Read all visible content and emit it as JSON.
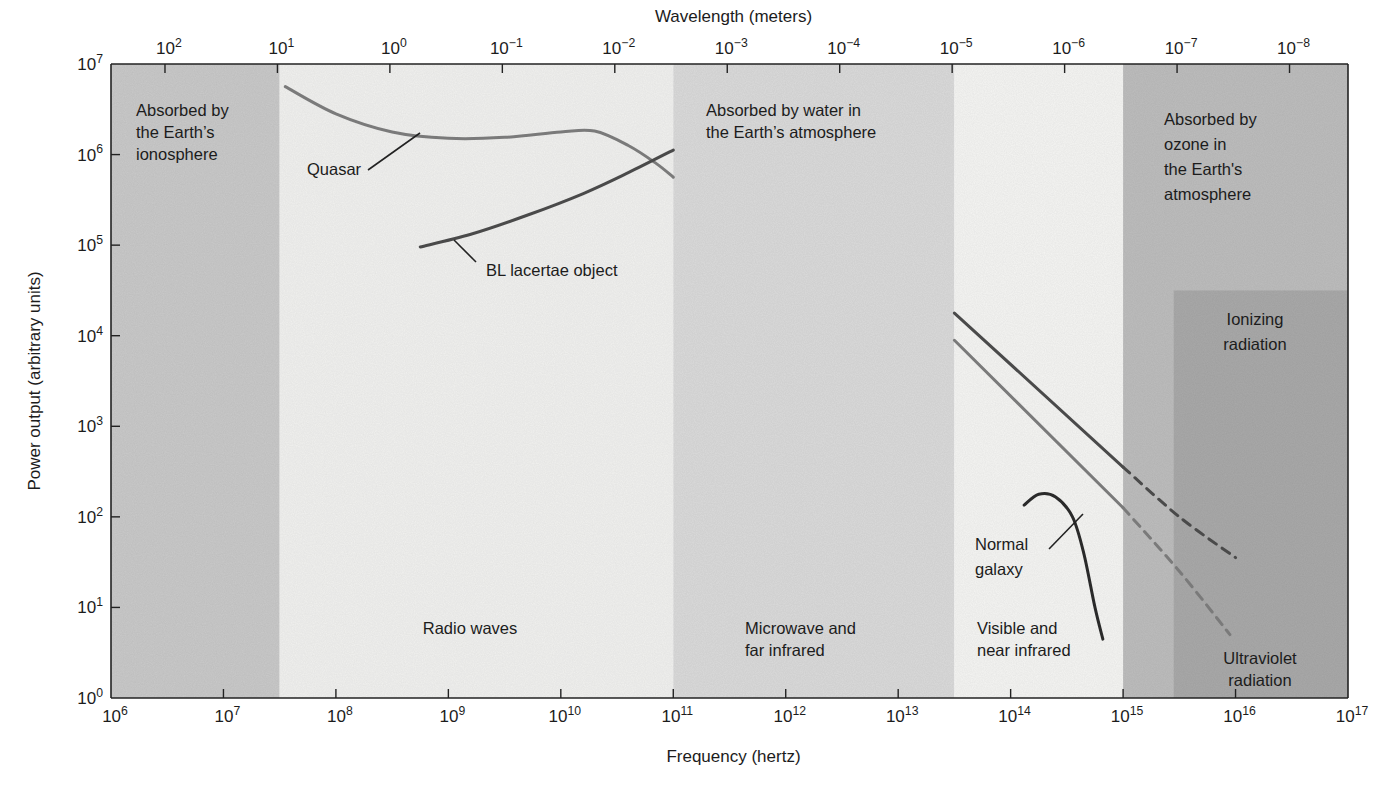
{
  "chart_data": {
    "type": "line",
    "title": "",
    "xlabel": "Frequency (hertz)",
    "ylabel": "Power output (arbitrary units)",
    "x2label": "Wavelength (meters)",
    "xscale": "log",
    "yscale": "log",
    "xlim": [
      1000000.0,
      1e+17
    ],
    "ylim": [
      1,
      10000000.0
    ],
    "grid": false,
    "legend": "none (curves labeled inline)",
    "x_ticks": [
      {
        "exp": 6,
        "label": "10",
        "sup": "6"
      },
      {
        "exp": 7,
        "label": "10",
        "sup": "7"
      },
      {
        "exp": 8,
        "label": "10",
        "sup": "8"
      },
      {
        "exp": 9,
        "label": "10",
        "sup": "9"
      },
      {
        "exp": 10,
        "label": "10",
        "sup": "10"
      },
      {
        "exp": 11,
        "label": "10",
        "sup": "11"
      },
      {
        "exp": 12,
        "label": "10",
        "sup": "12"
      },
      {
        "exp": 13,
        "label": "10",
        "sup": "13"
      },
      {
        "exp": 14,
        "label": "10",
        "sup": "14"
      },
      {
        "exp": 15,
        "label": "10",
        "sup": "15"
      },
      {
        "exp": 16,
        "label": "10",
        "sup": "16"
      },
      {
        "exp": 17,
        "label": "10",
        "sup": "17"
      }
    ],
    "y_ticks": [
      {
        "exp": 0,
        "label": "10",
        "sup": "0"
      },
      {
        "exp": 1,
        "label": "10",
        "sup": "1"
      },
      {
        "exp": 2,
        "label": "10",
        "sup": "2"
      },
      {
        "exp": 3,
        "label": "10",
        "sup": "3"
      },
      {
        "exp": 4,
        "label": "10",
        "sup": "4"
      },
      {
        "exp": 5,
        "label": "10",
        "sup": "5"
      },
      {
        "exp": 6,
        "label": "10",
        "sup": "6"
      },
      {
        "exp": 7,
        "label": "10",
        "sup": "7"
      }
    ],
    "wavelength_ticks": [
      {
        "freq_exp": 6.48,
        "label": "10",
        "sup": "2"
      },
      {
        "freq_exp": 7.48,
        "label": "10",
        "sup": "1"
      },
      {
        "freq_exp": 8.48,
        "label": "10",
        "sup": "0"
      },
      {
        "freq_exp": 9.48,
        "label": "10",
        "sup": "−1"
      },
      {
        "freq_exp": 10.48,
        "label": "10",
        "sup": "−2"
      },
      {
        "freq_exp": 11.48,
        "label": "10",
        "sup": "−3"
      },
      {
        "freq_exp": 12.48,
        "label": "10",
        "sup": "−4"
      },
      {
        "freq_exp": 13.48,
        "label": "10",
        "sup": "−5"
      },
      {
        "freq_exp": 14.48,
        "label": "10",
        "sup": "−6"
      },
      {
        "freq_exp": 15.48,
        "label": "10",
        "sup": "−7"
      },
      {
        "freq_exp": 16.48,
        "label": "10",
        "sup": "−8"
      }
    ],
    "bands": [
      {
        "name": "ionosphere",
        "from_exp": 6,
        "to_exp": 7.5,
        "y_from_exp": 0,
        "y_to_exp": 7,
        "color": "#c9c9c9",
        "labels": [
          "Absorbed by",
          "the Earth’s",
          "ionosphere"
        ]
      },
      {
        "name": "radio",
        "from_exp": 7.5,
        "to_exp": 11,
        "y_from_exp": 0,
        "y_to_exp": 7,
        "color": "#f1f1ef",
        "labels": [
          "Radio waves"
        ]
      },
      {
        "name": "microwave",
        "from_exp": 11,
        "to_exp": 13.5,
        "y_from_exp": 0,
        "y_to_exp": 7,
        "color": "#dadada",
        "labels": [
          "Microwave and",
          "far infrared"
        ],
        "top_labels": [
          "Absorbed by water in",
          "the Earth’s atmosphere"
        ]
      },
      {
        "name": "visible",
        "from_exp": 13.5,
        "to_exp": 15,
        "y_from_exp": 0,
        "y_to_exp": 7,
        "color": "#f5f5f3",
        "labels": [
          "Visible and",
          "near infrared"
        ]
      },
      {
        "name": "ozone",
        "from_exp": 15,
        "to_exp": 17,
        "y_from_exp": 0,
        "y_to_exp": 7,
        "color": "#bdbdbd",
        "labels": [
          "Absorbed by",
          "ozone in",
          "the Earth's",
          "atmosphere"
        ]
      },
      {
        "name": "ionizing",
        "from_exp": 15.45,
        "to_exp": 17,
        "y_from_exp": 0,
        "y_to_exp": 4.5,
        "color": "#a9a9a9",
        "labels": [
          "Ionizing",
          "radiation"
        ],
        "bottom_labels": [
          "Ultraviolet",
          "radiation"
        ]
      }
    ],
    "series": [
      {
        "name": "Quasar",
        "color": "#7a7a7a",
        "style": "solid",
        "points": [
          [
            7.55,
            6.75
          ],
          [
            8.0,
            6.45
          ],
          [
            8.5,
            6.25
          ],
          [
            9.0,
            6.18
          ],
          [
            9.5,
            6.19
          ],
          [
            10.0,
            6.25
          ],
          [
            10.3,
            6.26
          ],
          [
            10.6,
            6.1
          ],
          [
            10.85,
            5.9
          ],
          [
            11.0,
            5.75
          ]
        ]
      },
      {
        "name": "BL lacertae object",
        "color": "#4a4a4a",
        "style": "solid",
        "points": [
          [
            8.75,
            4.98
          ],
          [
            9.2,
            5.12
          ],
          [
            9.7,
            5.33
          ],
          [
            10.2,
            5.57
          ],
          [
            10.6,
            5.8
          ],
          [
            11.0,
            6.05
          ]
        ]
      },
      {
        "name": "Quasar (optical/UV)",
        "color": "#7a7a7a",
        "style": "solid",
        "points": [
          [
            13.5,
            3.95
          ],
          [
            15.0,
            2.1
          ]
        ]
      },
      {
        "name": "Quasar (UV extrapolated)",
        "color": "#7a7a7a",
        "style": "dashed",
        "points": [
          [
            15.0,
            2.1
          ],
          [
            15.5,
            1.4
          ],
          [
            15.95,
            0.7
          ]
        ]
      },
      {
        "name": "BL lacertae object (optical/UV)",
        "color": "#4a4a4a",
        "style": "solid",
        "points": [
          [
            13.5,
            4.25
          ],
          [
            15.0,
            2.55
          ]
        ]
      },
      {
        "name": "BL lacertae object (UV extrapolated)",
        "color": "#4a4a4a",
        "style": "dashed",
        "points": [
          [
            15.0,
            2.55
          ],
          [
            15.5,
            2.0
          ],
          [
            16.0,
            1.55
          ]
        ]
      },
      {
        "name": "Normal galaxy",
        "color": "#2a2a2a",
        "style": "solid",
        "points": [
          [
            14.12,
            2.13
          ],
          [
            14.25,
            2.25
          ],
          [
            14.4,
            2.22
          ],
          [
            14.55,
            2.0
          ],
          [
            14.65,
            1.6
          ],
          [
            14.75,
            1.0
          ],
          [
            14.82,
            0.65
          ]
        ]
      }
    ],
    "annotations": [
      {
        "text": "Quasar",
        "x_exp": 8.45,
        "y_exp": 5.75
      },
      {
        "text": "BL lacertae object",
        "x_exp": 9.35,
        "y_exp": 4.55
      },
      {
        "text": "Normal",
        "x_exp": 14.07,
        "y_exp": 1.3
      },
      {
        "text": "galaxy",
        "x_exp": 14.07,
        "y_exp": 1.05
      }
    ]
  },
  "axes": {
    "top_title": "Wavelength (meters)",
    "bottom_title": "Frequency (hertz)",
    "left_title": "Power output (arbitrary units)"
  },
  "bands_text": {
    "ionosphere": [
      "Absorbed by",
      "the Earth’s",
      "ionosphere"
    ],
    "water": [
      "Absorbed by water in",
      "the Earth’s atmosphere"
    ],
    "ozone": [
      "Absorbed by",
      "ozone in",
      "the Earth's",
      "atmosphere"
    ],
    "ionizing": [
      "Ionizing",
      "radiation"
    ],
    "radio": [
      "Radio waves"
    ],
    "microwave": [
      "Microwave and",
      "far infrared"
    ],
    "visible": [
      "Visible and",
      "near infrared"
    ],
    "ultraviolet": [
      "Ultraviolet",
      "radiation"
    ]
  },
  "curve_labels": {
    "quasar": "Quasar",
    "bl": "BL lacertae object",
    "galaxy": [
      "Normal",
      "galaxy"
    ]
  }
}
